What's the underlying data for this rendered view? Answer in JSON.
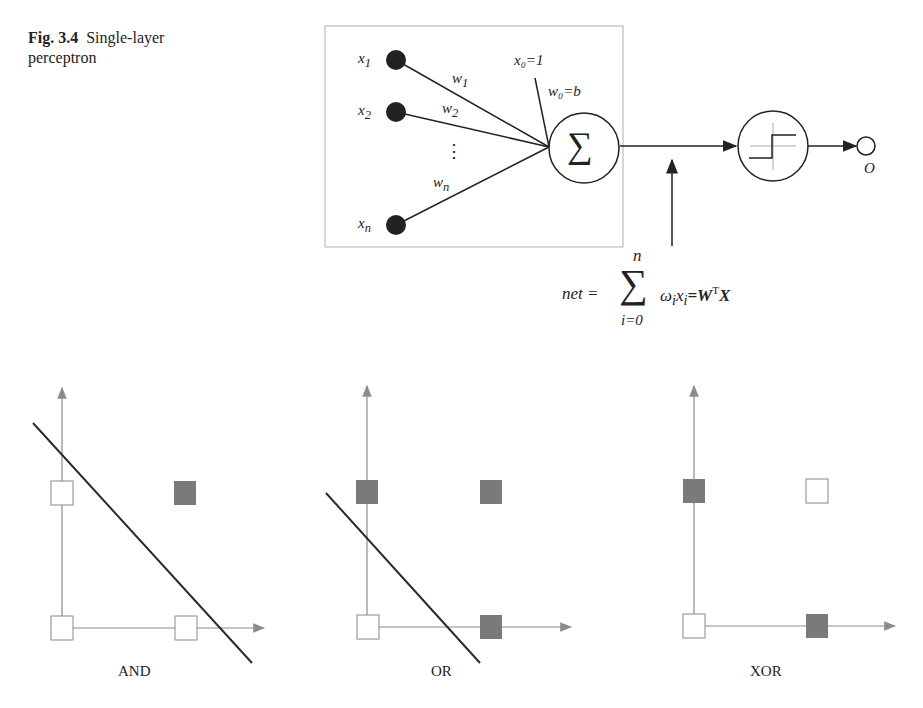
{
  "caption": {
    "figure_number": "Fig. 3.4",
    "title_line1": "Single-layer",
    "title_line2": "perceptron"
  },
  "perceptron": {
    "inputs": [
      {
        "label": "x",
        "sub": "1",
        "weight": "w",
        "wsub": "1"
      },
      {
        "label": "x",
        "sub": "2",
        "weight": "w",
        "wsub": "2"
      },
      {
        "label": "x",
        "sub": "n",
        "weight": "w",
        "wsub": "n"
      }
    ],
    "ellipsis": "⋮",
    "bias_input": "x₀=1",
    "bias_weight": "w₀=b",
    "summation_symbol": "∑",
    "output_label": "O",
    "net_label": "net =",
    "sum_upper": "n",
    "sum_lower": "i=0",
    "sum_term": "ω",
    "sum_term_sub": "i",
    "sum_x": "x",
    "sum_x_sub": "i",
    "equals_W": "=W",
    "transpose": "T",
    "X": "X"
  },
  "plots": [
    {
      "label": "AND",
      "points": [
        {
          "x": 0,
          "y": 0,
          "class": 0
        },
        {
          "x": 1,
          "y": 0,
          "class": 0
        },
        {
          "x": 0,
          "y": 1,
          "class": 0
        },
        {
          "x": 1,
          "y": 1,
          "class": 1
        }
      ],
      "separable": true
    },
    {
      "label": "OR",
      "points": [
        {
          "x": 0,
          "y": 0,
          "class": 0
        },
        {
          "x": 1,
          "y": 0,
          "class": 1
        },
        {
          "x": 0,
          "y": 1,
          "class": 1
        },
        {
          "x": 1,
          "y": 1,
          "class": 1
        }
      ],
      "separable": true
    },
    {
      "label": "XOR",
      "points": [
        {
          "x": 0,
          "y": 0,
          "class": 0
        },
        {
          "x": 1,
          "y": 0,
          "class": 1
        },
        {
          "x": 0,
          "y": 1,
          "class": 1
        },
        {
          "x": 1,
          "y": 1,
          "class": 0
        }
      ],
      "separable": false
    }
  ],
  "colors": {
    "filled": "#7a7a7a",
    "axis": "#8c8c8c",
    "line": "#2a2a2a",
    "box_border": "#b0b0b0"
  }
}
